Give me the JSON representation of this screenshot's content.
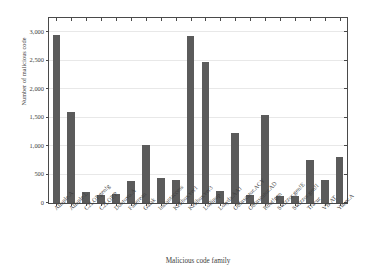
{
  "chart_data": {
    "type": "bar",
    "title": "",
    "subtitle": "",
    "xlabel": "Malicious code family",
    "ylabel": "Number of malicious code",
    "grid": true,
    "legend": null,
    "legend_position": "none",
    "xlim": [
      0,
      25
    ],
    "ylim": [
      0,
      3250
    ],
    "ytick_labels": [
      "0",
      "500",
      "1,000",
      "1,500",
      "2,000",
      "2,500",
      "3,000"
    ],
    "ytick_values": [
      0,
      500,
      1000,
      1500,
      2000,
      2500,
      3000
    ],
    "bar_color": "#5b5b5b",
    "axis_color": "#4a4a4a",
    "grid_color": "#e8e8e8",
    "categories": [
      "Allaple.A",
      "Allaple.L",
      "C2LOP.gen!g",
      "C2LOP.P",
      "Dontovo.A",
      "Fakerean",
      "Gatak",
      "Instantaccess",
      "Kelihos.ver1",
      "Kelihos.ver3",
      "Lollipop",
      "Lolyda.AA1",
      "Obfuscator.ACY",
      "Obfuscator.AD",
      "Rbot!gen",
      "Swizzor.gen!E",
      "Swizzor.gen!I",
      "Tracur",
      "VB.AT",
      "Yuner.A"
    ],
    "values": [
      2949,
      1591,
      200,
      146,
      162,
      381,
      1013,
      431,
      398,
      2942,
      2480,
      213,
      1228,
      142,
      1541,
      128,
      132,
      751,
      408,
      800
    ],
    "units": "files"
  }
}
